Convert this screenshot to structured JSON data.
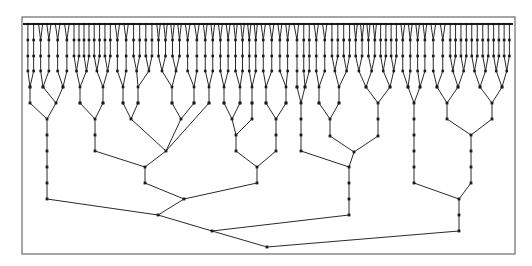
{
  "diagram": {
    "type": "tree",
    "colors": {
      "frame": "#6b6b6b",
      "edge": "#2a2a2a",
      "node": "#1a1a1a",
      "background": "#ffffff"
    },
    "frame": {
      "x": 22,
      "y": 17,
      "width": 493,
      "height": 237
    },
    "levels_y": [
      24,
      40,
      56,
      71,
      87,
      103,
      119,
      135,
      151,
      167,
      183,
      199,
      215,
      231,
      247
    ],
    "leaf_row": {
      "y": 24,
      "x_start": 25,
      "x_end": 512
    },
    "nodes": [
      {
        "id": "root",
        "x": 267,
        "y": 247
      },
      {
        "id": "A",
        "x": 212,
        "y": 231,
        "parent": "root"
      },
      {
        "id": "B",
        "x": 459,
        "y": 231,
        "parent": "root"
      },
      {
        "id": "A1",
        "x": 158,
        "y": 215,
        "parent": "A"
      },
      {
        "id": "A2",
        "x": 349,
        "y": 215,
        "parent": "A"
      },
      {
        "id": "L1",
        "x": 47,
        "y": 199,
        "parent": "A1"
      },
      {
        "id": "L2",
        "x": 47,
        "y": 183,
        "parent": "L1"
      },
      {
        "id": "L3",
        "x": 47,
        "y": 167,
        "parent": "L2"
      },
      {
        "id": "L4",
        "x": 47,
        "y": 151,
        "parent": "L3"
      },
      {
        "id": "L5",
        "x": 47,
        "y": 135,
        "parent": "L4"
      },
      {
        "id": "L6",
        "x": 47,
        "y": 119,
        "parent": "L5"
      },
      {
        "id": "L7a",
        "x": 30,
        "y": 103,
        "parent": "L6"
      },
      {
        "id": "L7b",
        "x": 56,
        "y": 103,
        "parent": "L6"
      },
      {
        "id": "L8a",
        "x": 30,
        "y": 87,
        "parent": "L7a"
      },
      {
        "id": "L8b",
        "x": 43,
        "y": 87,
        "parent": "L7b"
      },
      {
        "id": "L8c",
        "x": 63,
        "y": 87,
        "parent": "L7b"
      },
      {
        "id": "M",
        "x": 184,
        "y": 199,
        "parent": "A1"
      },
      {
        "id": "M1",
        "x": 145,
        "y": 183,
        "parent": "M"
      },
      {
        "id": "M2",
        "x": 257,
        "y": 183,
        "parent": "M"
      },
      {
        "id": "M1a",
        "x": 145,
        "y": 167,
        "parent": "M1"
      },
      {
        "id": "M1b",
        "x": 95,
        "y": 151,
        "parent": "M1a"
      },
      {
        "id": "M1c",
        "x": 166,
        "y": 151,
        "parent": "M1a"
      },
      {
        "id": "M1d",
        "x": 95,
        "y": 135,
        "parent": "M1b"
      },
      {
        "id": "M1e",
        "x": 95,
        "y": 119,
        "parent": "M1d"
      },
      {
        "id": "M1f",
        "x": 80,
        "y": 103,
        "parent": "M1e"
      },
      {
        "id": "M1g",
        "x": 103,
        "y": 103,
        "parent": "M1e"
      },
      {
        "id": "M1h",
        "x": 131,
        "y": 119,
        "parent": "M1c"
      },
      {
        "id": "M1i",
        "x": 181,
        "y": 119,
        "parent": "M1c"
      },
      {
        "id": "M1j",
        "x": 123,
        "y": 103,
        "parent": "M1h"
      },
      {
        "id": "M1k",
        "x": 138,
        "y": 103,
        "parent": "M1h"
      },
      {
        "id": "M1l",
        "x": 172,
        "y": 103,
        "parent": "M1i"
      },
      {
        "id": "M1m",
        "x": 194,
        "y": 103,
        "parent": "M1i"
      },
      {
        "id": "M1n",
        "x": 209,
        "y": 103,
        "parent": "M1c"
      },
      {
        "id": "M2a",
        "x": 257,
        "y": 167,
        "parent": "M2"
      },
      {
        "id": "M2b",
        "x": 236,
        "y": 151,
        "parent": "M2a"
      },
      {
        "id": "M2c",
        "x": 276,
        "y": 151,
        "parent": "M2a"
      },
      {
        "id": "M2d",
        "x": 236,
        "y": 135,
        "parent": "M2b"
      },
      {
        "id": "M2e",
        "x": 232,
        "y": 119,
        "parent": "M2d"
      },
      {
        "id": "M2f",
        "x": 252,
        "y": 119,
        "parent": "M2d"
      },
      {
        "id": "M2g",
        "x": 276,
        "y": 135,
        "parent": "M2c"
      },
      {
        "id": "M2h",
        "x": 276,
        "y": 119,
        "parent": "M2g"
      },
      {
        "id": "M2i",
        "x": 266,
        "y": 103,
        "parent": "M2h"
      },
      {
        "id": "M2j",
        "x": 286,
        "y": 103,
        "parent": "M2h"
      },
      {
        "id": "M2k",
        "x": 224,
        "y": 103,
        "parent": "M2e"
      },
      {
        "id": "M2l",
        "x": 240,
        "y": 103,
        "parent": "M2e"
      },
      {
        "id": "M2m",
        "x": 252,
        "y": 103,
        "parent": "M2f"
      },
      {
        "id": "N",
        "x": 349,
        "y": 199,
        "parent": "A2"
      },
      {
        "id": "N1",
        "x": 349,
        "y": 183,
        "parent": "N"
      },
      {
        "id": "N2",
        "x": 349,
        "y": 167,
        "parent": "N1"
      },
      {
        "id": "N3",
        "x": 301,
        "y": 151,
        "parent": "N2"
      },
      {
        "id": "N4",
        "x": 354,
        "y": 152,
        "parent": "N2"
      },
      {
        "id": "N3a",
        "x": 301,
        "y": 135,
        "parent": "N3"
      },
      {
        "id": "N3b",
        "x": 301,
        "y": 119,
        "parent": "N3a"
      },
      {
        "id": "N3c",
        "x": 301,
        "y": 103,
        "parent": "N3b"
      },
      {
        "id": "N3d",
        "x": 297,
        "y": 87,
        "parent": "N3c"
      },
      {
        "id": "N3e",
        "x": 305,
        "y": 87,
        "parent": "N3c"
      },
      {
        "id": "N4a",
        "x": 330,
        "y": 136,
        "parent": "N4"
      },
      {
        "id": "N4b",
        "x": 378,
        "y": 136,
        "parent": "N4"
      },
      {
        "id": "N4c",
        "x": 330,
        "y": 119,
        "parent": "N4a"
      },
      {
        "id": "N4d",
        "x": 319,
        "y": 103,
        "parent": "N4c"
      },
      {
        "id": "N4e",
        "x": 339,
        "y": 103,
        "parent": "N4c"
      },
      {
        "id": "N4f",
        "x": 378,
        "y": 119,
        "parent": "N4b"
      },
      {
        "id": "N4g",
        "x": 378,
        "y": 103,
        "parent": "N4f"
      },
      {
        "id": "N4h",
        "x": 366,
        "y": 87,
        "parent": "N4g"
      },
      {
        "id": "N4i",
        "x": 390,
        "y": 87,
        "parent": "N4g"
      },
      {
        "id": "B1",
        "x": 459,
        "y": 215,
        "parent": "B"
      },
      {
        "id": "B2",
        "x": 459,
        "y": 199,
        "parent": "B1"
      },
      {
        "id": "B3",
        "x": 414,
        "y": 183,
        "parent": "B2"
      },
      {
        "id": "B4",
        "x": 471,
        "y": 183,
        "parent": "B2"
      },
      {
        "id": "B3a",
        "x": 414,
        "y": 167,
        "parent": "B3"
      },
      {
        "id": "B3b",
        "x": 414,
        "y": 151,
        "parent": "B3a"
      },
      {
        "id": "B3c",
        "x": 414,
        "y": 135,
        "parent": "B3b"
      },
      {
        "id": "B3d",
        "x": 414,
        "y": 119,
        "parent": "B3c"
      },
      {
        "id": "B3e",
        "x": 414,
        "y": 103,
        "parent": "B3d"
      },
      {
        "id": "B3f",
        "x": 408,
        "y": 87,
        "parent": "B3e"
      },
      {
        "id": "B3g",
        "x": 420,
        "y": 87,
        "parent": "B3e"
      },
      {
        "id": "B4a",
        "x": 471,
        "y": 167,
        "parent": "B4"
      },
      {
        "id": "B4b",
        "x": 471,
        "y": 151,
        "parent": "B4a"
      },
      {
        "id": "B4c",
        "x": 471,
        "y": 135,
        "parent": "B4b"
      },
      {
        "id": "B4d",
        "x": 447,
        "y": 119,
        "parent": "B4c"
      },
      {
        "id": "B4e",
        "x": 492,
        "y": 119,
        "parent": "B4c"
      },
      {
        "id": "B4f",
        "x": 447,
        "y": 103,
        "parent": "B4d"
      },
      {
        "id": "B4g",
        "x": 492,
        "y": 103,
        "parent": "B4e"
      },
      {
        "id": "B4h",
        "x": 437,
        "y": 87,
        "parent": "B4f"
      },
      {
        "id": "B4i",
        "x": 458,
        "y": 87,
        "parent": "B4f"
      },
      {
        "id": "B4j",
        "x": 480,
        "y": 87,
        "parent": "B4g"
      },
      {
        "id": "B4k",
        "x": 502,
        "y": 87,
        "parent": "B4g"
      }
    ],
    "upper_fan": {
      "description": "Dense binary fan-out from level y=87 up to leaf row at y=24",
      "levels": [
        87,
        71,
        56,
        40,
        24
      ],
      "leaf_spacing": 4.1
    }
  }
}
